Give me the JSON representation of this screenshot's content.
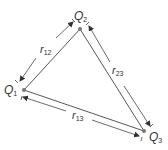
{
  "diagram": {
    "charges": [
      {
        "id": "Q1",
        "symbol": "Q",
        "sub": "1",
        "x": 24,
        "y": 90
      },
      {
        "id": "Q2",
        "symbol": "Q",
        "sub": "2",
        "x": 80,
        "y": 29
      },
      {
        "id": "Q3",
        "symbol": "Q",
        "sub": "3",
        "x": 144,
        "y": 131
      }
    ],
    "distances": [
      {
        "id": "r12",
        "symbol": "r",
        "sub": "12",
        "between": [
          "Q1",
          "Q2"
        ]
      },
      {
        "id": "r23",
        "symbol": "r",
        "sub": "23",
        "between": [
          "Q2",
          "Q3"
        ]
      },
      {
        "id": "r13",
        "symbol": "r",
        "sub": "13",
        "between": [
          "Q1",
          "Q3"
        ]
      }
    ],
    "colors": {
      "line": "#444444",
      "dot": "#777777",
      "text": "#333333"
    }
  }
}
